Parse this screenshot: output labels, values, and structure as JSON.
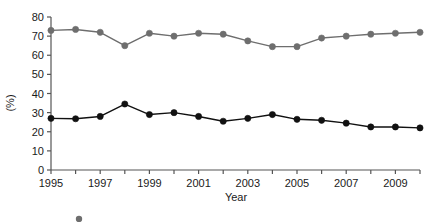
{
  "chart_data": {
    "type": "line",
    "title": "",
    "xlabel": "Year",
    "ylabel": "(%)",
    "xlim": [
      1995,
      2010
    ],
    "ylim": [
      0,
      80
    ],
    "grid": false,
    "legend_position": "bottom",
    "x": [
      1995,
      1996,
      1997,
      1998,
      1999,
      2000,
      2001,
      2002,
      2003,
      2004,
      2005,
      2006,
      2007,
      2008,
      2009,
      2010
    ],
    "xtick_labels": [
      "1995",
      "1997",
      "1999",
      "2001",
      "2003",
      "2005",
      "2007",
      "2009"
    ],
    "xtick_values": [
      1995,
      1997,
      1999,
      2001,
      2003,
      2005,
      2007,
      2009
    ],
    "ytick_labels": [
      "0",
      "10",
      "20",
      "30",
      "40",
      "50",
      "60",
      "70",
      "80"
    ],
    "ytick_values": [
      0,
      10,
      20,
      30,
      40,
      50,
      60,
      70,
      80
    ],
    "series": [
      {
        "name": "upper-series",
        "color": "#6e6e6e",
        "marker": "circle",
        "values": [
          73.0,
          73.5,
          72.0,
          65.0,
          71.5,
          70.0,
          71.5,
          71.0,
          67.5,
          64.5,
          64.5,
          69.0,
          70.0,
          71.0,
          71.5,
          72.0
        ]
      },
      {
        "name": "lower-series",
        "color": "#111111",
        "marker": "circle",
        "values": [
          27.0,
          26.8,
          28.0,
          34.5,
          29.0,
          30.0,
          28.0,
          25.5,
          27.0,
          29.0,
          26.5,
          26.0,
          24.5,
          22.5,
          22.5,
          22.0
        ]
      }
    ]
  },
  "axes": {
    "y_label": "(%)",
    "x_label": "Year"
  },
  "legend": {
    "clipped_note": "",
    "items": [
      {
        "marker_color": "#6e6e6e",
        "label": ""
      }
    ]
  }
}
